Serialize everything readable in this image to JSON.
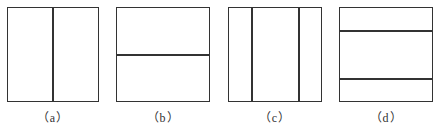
{
  "figure": {
    "line_color": "#333333",
    "background": "#ffffff",
    "panels": [
      {
        "label": "（a）",
        "box": {
          "x": 7,
          "y": 7,
          "w": 92,
          "h": 95
        },
        "division": "vertical",
        "parts": 2,
        "divider_positions": [
          45
        ]
      },
      {
        "label": "（b）",
        "box": {
          "x": 116,
          "y": 7,
          "w": 94,
          "h": 95
        },
        "division": "horizontal",
        "parts": 2,
        "divider_positions": [
          47
        ]
      },
      {
        "label": "（c）",
        "box": {
          "x": 228,
          "y": 7,
          "w": 94,
          "h": 95
        },
        "division": "vertical",
        "parts": 3,
        "divider_positions": [
          23,
          70
        ]
      },
      {
        "label": "（d）",
        "box": {
          "x": 339,
          "y": 7,
          "w": 94,
          "h": 95
        },
        "division": "horizontal",
        "parts": 3,
        "divider_positions": [
          23,
          71
        ]
      }
    ]
  }
}
